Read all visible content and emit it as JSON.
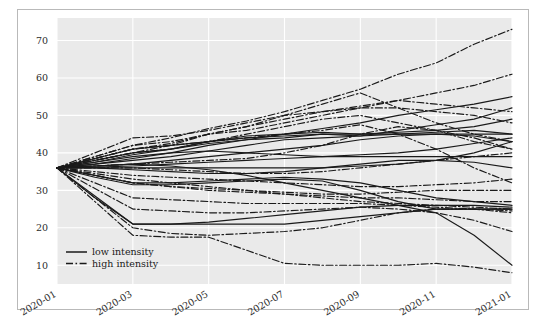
{
  "chart_data": {
    "type": "line",
    "title": "",
    "xlabel": "",
    "ylabel": "",
    "grid": true,
    "legend_position": "lower left (inside axes)",
    "x": [
      "2020-01",
      "2020-02",
      "2020-03",
      "2020-04",
      "2020-05",
      "2020-06",
      "2020-07",
      "2020-08",
      "2020-09",
      "2020-10",
      "2020-11",
      "2020-12",
      "2021-01"
    ],
    "xtick_labels": [
      "2020-01",
      "2020-03",
      "2020-05",
      "2020-07",
      "2020-09",
      "2020-11",
      "2021-01"
    ],
    "ytick_labels": [
      "10",
      "20",
      "30",
      "40",
      "50",
      "60",
      "70"
    ],
    "ylim": [
      5,
      76
    ],
    "xlim": [
      "2020-01",
      "2021-01"
    ],
    "plot_bg": "#eaeaea",
    "grid_color": "#ffffff",
    "line_color": "#1a1a1a",
    "series": [
      {
        "name": "low-1",
        "style": "solid",
        "intensity": "low",
        "values": [
          36,
          38,
          40,
          41,
          43,
          44.5,
          45,
          46.5,
          48,
          50,
          51.5,
          53,
          55
        ]
      },
      {
        "name": "low-2",
        "style": "solid",
        "intensity": "low",
        "values": [
          36,
          37.5,
          39.5,
          41,
          42.5,
          43.5,
          44,
          45,
          44.5,
          46,
          47.5,
          49,
          52
        ]
      },
      {
        "name": "low-3",
        "style": "solid",
        "intensity": "low",
        "values": [
          36,
          37,
          38.5,
          40,
          42,
          43.5,
          45,
          45.5,
          45,
          45.5,
          46,
          47,
          49
        ]
      },
      {
        "name": "low-4",
        "style": "solid",
        "intensity": "low",
        "values": [
          36,
          38.5,
          41,
          42,
          43,
          44,
          44.5,
          45,
          45,
          45,
          45,
          45,
          45
        ]
      },
      {
        "name": "low-5",
        "style": "solid",
        "intensity": "low",
        "values": [
          36,
          37,
          38,
          39,
          40.5,
          42,
          43.5,
          44,
          44.5,
          45,
          45.5,
          46,
          45
        ]
      },
      {
        "name": "low-6",
        "style": "solid",
        "intensity": "low",
        "values": [
          36,
          36.5,
          37,
          38,
          39,
          40,
          41,
          42,
          43.5,
          44.5,
          45,
          44.5,
          43
        ]
      },
      {
        "name": "low-7",
        "style": "solid",
        "intensity": "low",
        "values": [
          36,
          37.5,
          39,
          40,
          40.5,
          40,
          39.5,
          39,
          39,
          39,
          39,
          39,
          39
        ]
      },
      {
        "name": "low-8",
        "style": "solid",
        "intensity": "low",
        "values": [
          36,
          36.2,
          36.5,
          37,
          37.5,
          38,
          38.5,
          39,
          39.5,
          40,
          41,
          42.5,
          44
        ]
      },
      {
        "name": "low-9",
        "style": "solid",
        "intensity": "low",
        "values": [
          36,
          36,
          36,
          36,
          36,
          36,
          36,
          36,
          36.5,
          37,
          38,
          40,
          43
        ]
      },
      {
        "name": "low-10",
        "style": "solid",
        "intensity": "low",
        "values": [
          36,
          36,
          35.5,
          35,
          34.5,
          34.5,
          35,
          36,
          37,
          38,
          38,
          37.5,
          36
        ]
      },
      {
        "name": "low-11",
        "style": "solid",
        "intensity": "low",
        "values": [
          36,
          34,
          32,
          32,
          32.5,
          33,
          33.5,
          33,
          32,
          30,
          28,
          27,
          26
        ]
      },
      {
        "name": "low-12",
        "style": "solid",
        "intensity": "low",
        "values": [
          36,
          33.5,
          31.5,
          31.5,
          32,
          32.5,
          33,
          32.5,
          30,
          27,
          25,
          25,
          25
        ]
      },
      {
        "name": "low-13",
        "style": "solid",
        "intensity": "low",
        "values": [
          36,
          28,
          21,
          21,
          21.5,
          22.5,
          23.5,
          24.5,
          25.5,
          26,
          26,
          26,
          25.5
        ]
      },
      {
        "name": "low-14",
        "style": "solid",
        "intensity": "low",
        "values": [
          36,
          28.5,
          21,
          21,
          21,
          21,
          21,
          22,
          23,
          24,
          25,
          25,
          25
        ]
      },
      {
        "name": "low-15",
        "style": "solid",
        "intensity": "low",
        "values": [
          36,
          36.5,
          37,
          36.5,
          35.5,
          34,
          32,
          30,
          28,
          26,
          24,
          18,
          10
        ]
      },
      {
        "name": "high-1",
        "style": "dashdot",
        "intensity": "high",
        "values": [
          36,
          39,
          42,
          44,
          46.5,
          48.5,
          51,
          54,
          57,
          61,
          64,
          69,
          73
        ]
      },
      {
        "name": "high-2",
        "style": "dashdot",
        "intensity": "high",
        "values": [
          36,
          38.5,
          41,
          42.5,
          45,
          47,
          49,
          51,
          52.5,
          54,
          56,
          58,
          61
        ]
      },
      {
        "name": "high-3",
        "style": "dashdot",
        "intensity": "high",
        "values": [
          36,
          39,
          42,
          43,
          45,
          46,
          48,
          50,
          52,
          54,
          53,
          52,
          51
        ]
      },
      {
        "name": "high-4",
        "style": "dashdot",
        "intensity": "high",
        "values": [
          36,
          38,
          40,
          42,
          45,
          47,
          50,
          53,
          56,
          52,
          48,
          45,
          43
        ]
      },
      {
        "name": "high-5",
        "style": "dashdot",
        "intensity": "high",
        "values": [
          36,
          40,
          44,
          44.5,
          46,
          48,
          50,
          51,
          52,
          52,
          51,
          50,
          48
        ]
      },
      {
        "name": "high-6",
        "style": "dashdot",
        "intensity": "high",
        "values": [
          36,
          38,
          40,
          41,
          43,
          45,
          47,
          49,
          50,
          48,
          46,
          43,
          41
        ]
      },
      {
        "name": "high-7",
        "style": "dashdot",
        "intensity": "high",
        "values": [
          36,
          38.5,
          41,
          42,
          43,
          44,
          45,
          46,
          47.5,
          45,
          41,
          36,
          32
        ]
      },
      {
        "name": "high-8",
        "style": "dashdot",
        "intensity": "high",
        "values": [
          36,
          36.5,
          37,
          37.5,
          38,
          38.5,
          40,
          42,
          45,
          47,
          46,
          44,
          41
        ]
      },
      {
        "name": "high-9",
        "style": "dashdot",
        "intensity": "high",
        "values": [
          36,
          36,
          36,
          35.5,
          35,
          34.5,
          34.5,
          35,
          36,
          37,
          38,
          39,
          40
        ]
      },
      {
        "name": "high-10",
        "style": "dashdot",
        "intensity": "high",
        "values": [
          36,
          35,
          34,
          33.5,
          33,
          32.5,
          32,
          31.5,
          31,
          31,
          31.5,
          32,
          33
        ]
      },
      {
        "name": "high-11",
        "style": "dashdot",
        "intensity": "high",
        "values": [
          36,
          34,
          32,
          31,
          30.5,
          30,
          29.5,
          29,
          29,
          29.5,
          30,
          30,
          30
        ]
      },
      {
        "name": "high-12",
        "style": "dashdot",
        "intensity": "high",
        "values": [
          36,
          34.5,
          33,
          32,
          31,
          30,
          29,
          28.5,
          28,
          28,
          27.5,
          27,
          27
        ]
      },
      {
        "name": "high-13",
        "style": "dashdot",
        "intensity": "high",
        "values": [
          36,
          34,
          32,
          31,
          30,
          29.5,
          29,
          28,
          27,
          26.5,
          26,
          25.5,
          25
        ]
      },
      {
        "name": "high-14",
        "style": "dashdot",
        "intensity": "high",
        "values": [
          36,
          32,
          28,
          27.5,
          27,
          26.5,
          26.5,
          26.5,
          26.5,
          26,
          25.5,
          25,
          24
        ]
      },
      {
        "name": "high-15",
        "style": "dashdot",
        "intensity": "high",
        "values": [
          36,
          30.5,
          25,
          24.5,
          24,
          24,
          24.5,
          25,
          25.5,
          25,
          24,
          22,
          19
        ]
      },
      {
        "name": "high-16",
        "style": "dashdot",
        "intensity": "high",
        "values": [
          36,
          28,
          20,
          18.5,
          18,
          18.5,
          19,
          20,
          22,
          24,
          25,
          25,
          24.5
        ]
      },
      {
        "name": "high-17",
        "style": "dashdot",
        "intensity": "high",
        "values": [
          36,
          27,
          18,
          17.5,
          17.5,
          14,
          10.5,
          10,
          10,
          10,
          10.5,
          9.5,
          8
        ]
      }
    ],
    "legend": [
      {
        "label": "low intensity",
        "style": "solid"
      },
      {
        "label": "high intensity",
        "style": "dashdot"
      }
    ]
  }
}
